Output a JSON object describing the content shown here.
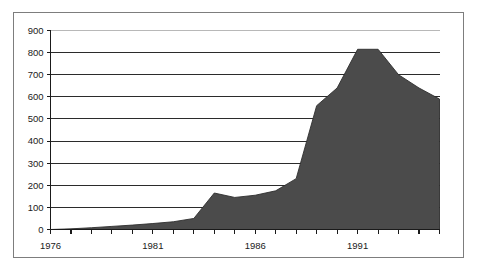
{
  "chart_data": {
    "type": "area",
    "title": "",
    "subtitle": "",
    "xlabel": "",
    "ylabel": "",
    "xlim": [
      1976,
      1995
    ],
    "ylim": [
      0,
      900
    ],
    "grid": true,
    "legend": false,
    "legend_position": "none",
    "y_ticks": [
      0,
      100,
      200,
      300,
      400,
      500,
      600,
      700,
      800,
      900
    ],
    "y_tick_labels": [
      "0",
      "100",
      "200",
      "300",
      "400",
      "500",
      "600",
      "700",
      "800",
      "900"
    ],
    "x_ticks": [
      1976,
      1977,
      1978,
      1979,
      1980,
      1981,
      1982,
      1983,
      1984,
      1985,
      1986,
      1987,
      1988,
      1989,
      1990,
      1991,
      1992,
      1993,
      1994,
      1995
    ],
    "x_tick_labels_shown": [
      "1976",
      "1981",
      "1986",
      "1991"
    ],
    "x_labeled_ticks": [
      1976,
      1981,
      1986,
      1991
    ],
    "series_name": "",
    "x": [
      1976,
      1977,
      1978,
      1979,
      1980,
      1981,
      1982,
      1983,
      1984,
      1985,
      1986,
      1987,
      1988,
      1989,
      1990,
      1991,
      1992,
      1993,
      1994,
      1995
    ],
    "values": [
      0,
      3,
      8,
      14,
      20,
      27,
      35,
      50,
      165,
      145,
      155,
      175,
      230,
      560,
      640,
      815,
      815,
      700,
      640,
      590
    ],
    "fill_color": "#4b4b4b",
    "line_color": "#2e2e2e",
    "gridline_color": "#2b2b2b",
    "background_color": "#ffffff",
    "frame_color": "#7d7d7d"
  },
  "figure": {
    "border_label": "chart-frame"
  }
}
